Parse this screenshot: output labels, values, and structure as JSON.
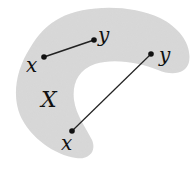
{
  "diagram": {
    "set_label": "X",
    "fill_color": "#d9d9d9",
    "line_color": "#222222",
    "segments": [
      {
        "name": "inside-segment",
        "start_label": "x",
        "end_label": "y",
        "lies_inside_set": true
      },
      {
        "name": "crossing-segment",
        "start_label": "x",
        "end_label": "y",
        "lies_inside_set": false
      }
    ]
  }
}
